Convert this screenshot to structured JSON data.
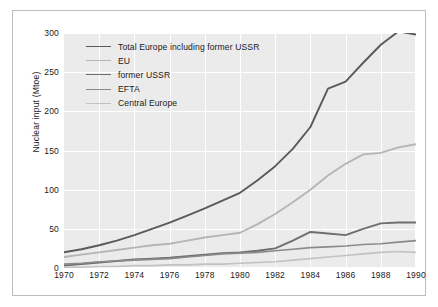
{
  "chart_data": {
    "type": "line",
    "title": "",
    "xlabel": "",
    "ylabel": "Nuclear input (Mtoe)",
    "xlim": [
      1970,
      1990
    ],
    "ylim": [
      0,
      300
    ],
    "yticks": [
      0,
      50,
      100,
      150,
      200,
      250,
      300
    ],
    "xticks": [
      1970,
      1972,
      1974,
      1976,
      1978,
      1980,
      1982,
      1984,
      1986,
      1988,
      1990
    ],
    "grid": true,
    "legend_position": "top-left",
    "x": [
      1970,
      1971,
      1972,
      1973,
      1974,
      1975,
      1976,
      1977,
      1978,
      1979,
      1980,
      1981,
      1982,
      1983,
      1984,
      1985,
      1986,
      1987,
      1988,
      1989,
      1990
    ],
    "series": [
      {
        "name": "Total Europe including former USSR",
        "color": "#5a5a5a",
        "width": 1.9,
        "values": [
          20,
          24,
          29,
          35,
          42,
          50,
          58,
          67,
          76,
          86,
          96,
          112,
          130,
          152,
          180,
          229,
          238,
          262,
          285,
          302,
          298
        ]
      },
      {
        "name": "EU",
        "color": "#b5b5b5",
        "width": 1.9,
        "values": [
          14,
          17,
          20,
          23,
          26,
          29,
          31,
          35,
          39,
          42,
          45,
          56,
          69,
          84,
          100,
          118,
          133,
          145,
          147,
          154,
          158
        ]
      },
      {
        "name": "former USSR",
        "color": "#6e6e6e",
        "width": 1.9,
        "values": [
          3,
          5,
          7,
          9,
          11,
          12,
          13,
          15,
          17,
          19,
          20,
          22,
          25,
          35,
          46,
          44,
          42,
          50,
          57,
          58,
          58
        ]
      },
      {
        "name": "EFTA",
        "color": "#8a8a8a",
        "width": 1.6,
        "values": [
          5,
          6,
          8,
          9,
          10,
          11,
          12,
          14,
          16,
          18,
          19,
          20,
          22,
          24,
          26,
          27,
          28,
          30,
          31,
          33,
          35
        ]
      },
      {
        "name": "Central Europe",
        "color": "#c2c2c2",
        "width": 1.6,
        "values": [
          1,
          1,
          2,
          2,
          3,
          3,
          4,
          4,
          5,
          5,
          6,
          7,
          8,
          10,
          12,
          14,
          16,
          18,
          20,
          21,
          20
        ]
      }
    ]
  },
  "legend": {
    "items": [
      {
        "label": "Total Europe including former USSR"
      },
      {
        "label": "EU"
      },
      {
        "label": "former USSR"
      },
      {
        "label": "EFTA"
      },
      {
        "label": "Central Europe"
      }
    ]
  }
}
